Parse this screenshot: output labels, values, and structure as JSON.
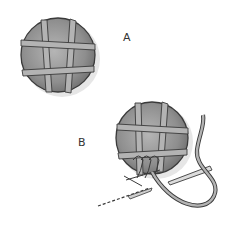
{
  "diagram": {
    "type": "illustration",
    "panels": [
      {
        "label": "A",
        "description": "disc wrapped with crossing threads forming a grid"
      },
      {
        "label": "B",
        "description": "disc with grid, needle and thread working loop stitches"
      }
    ]
  },
  "labels": {
    "a": "A",
    "b": "B"
  },
  "colors": {
    "disc_fill": "#8c8c8c",
    "disc_light": "#b5b5b5",
    "thread": "#a8a8a8",
    "outline": "#3a3a3a",
    "shadow": "#e2e2e2"
  }
}
